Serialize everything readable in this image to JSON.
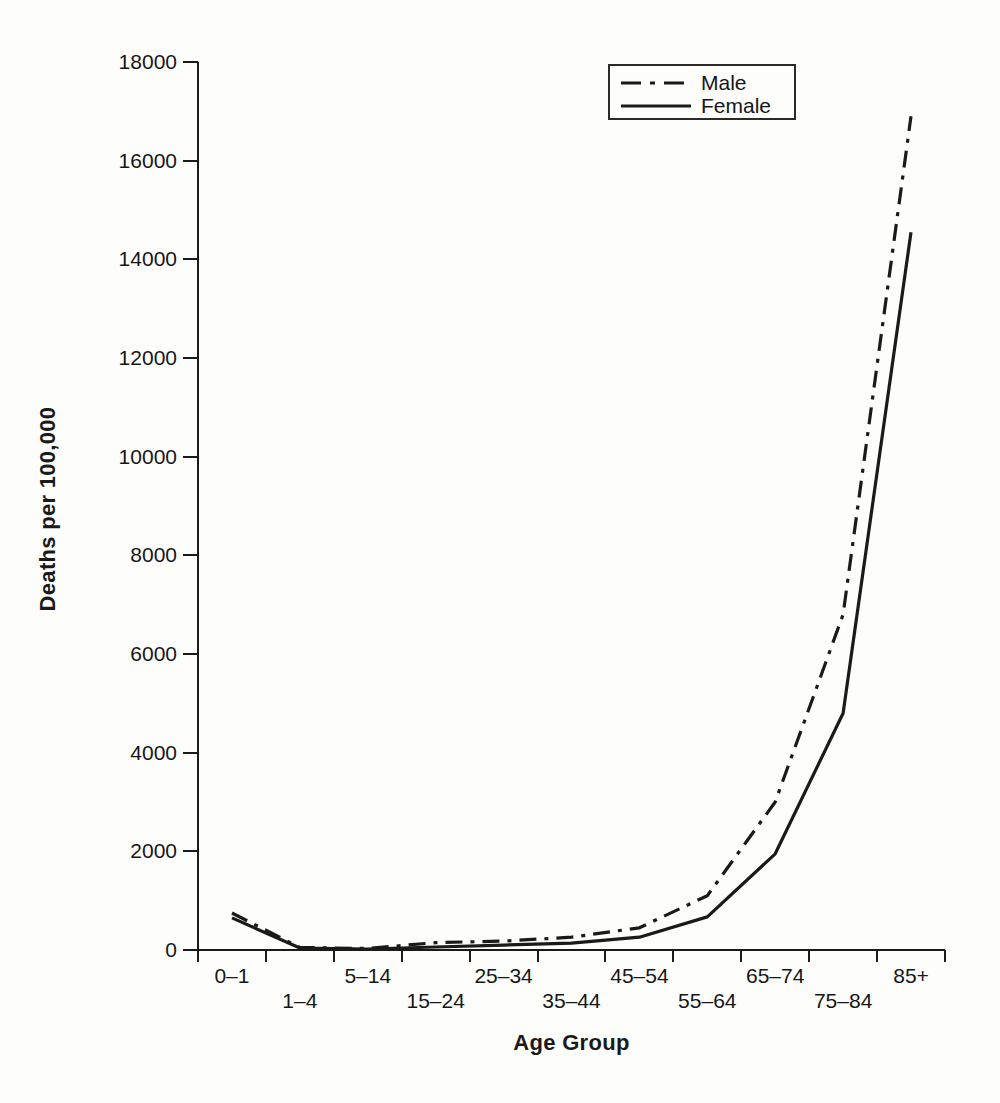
{
  "figure": {
    "background_color": "#fdfdfc",
    "ink_color": "#1a1a1a"
  },
  "legend": {
    "items": [
      {
        "label": "Male",
        "line_style": "dashdot"
      },
      {
        "label": "Female",
        "line_style": "solid"
      }
    ]
  },
  "chart_data": {
    "type": "line",
    "title": "",
    "xlabel": "Age Group",
    "ylabel": "Deaths per 100,000",
    "categories": [
      "0–1",
      "1–4",
      "5–14",
      "15–24",
      "25–34",
      "35–44",
      "45–54",
      "55–64",
      "65–74",
      "75–84",
      "85+"
    ],
    "series": [
      {
        "name": "Male",
        "line_style": "dashdot",
        "values": [
          750,
          50,
          30,
          150,
          180,
          260,
          450,
          1100,
          3000,
          6800,
          16900
        ]
      },
      {
        "name": "Female",
        "line_style": "solid",
        "values": [
          650,
          40,
          20,
          60,
          100,
          140,
          260,
          670,
          1950,
          4800,
          14550
        ]
      }
    ],
    "ylim": [
      0,
      18000
    ],
    "ytick_step": 2000,
    "ytick_labels": [
      "0",
      "2000",
      "4000",
      "6000",
      "8000",
      "10000",
      "12000",
      "14000",
      "16000",
      "18000"
    ],
    "grid": false,
    "legend_position": "top-right-inside",
    "x_labels_staggered": true,
    "line_color": "#1a1a1a"
  }
}
